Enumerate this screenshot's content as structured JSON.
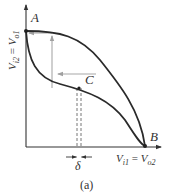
{
  "figure": {
    "caption": "(a)",
    "points": {
      "A": "A",
      "B": "B",
      "C": "C"
    },
    "y_axis": {
      "var": "V",
      "sub1": "i2",
      "eq": " = ",
      "var2": "V",
      "sub2": "o1"
    },
    "x_axis": {
      "var": "V",
      "sub1": "i1",
      "eq": " = ",
      "var2": "V",
      "sub2": "o2"
    },
    "delta_label": "δ",
    "colors": {
      "curve": "#2a2a2a",
      "axis": "#333333",
      "step_path": "#a8a8a8",
      "dashed": "#666666"
    }
  }
}
